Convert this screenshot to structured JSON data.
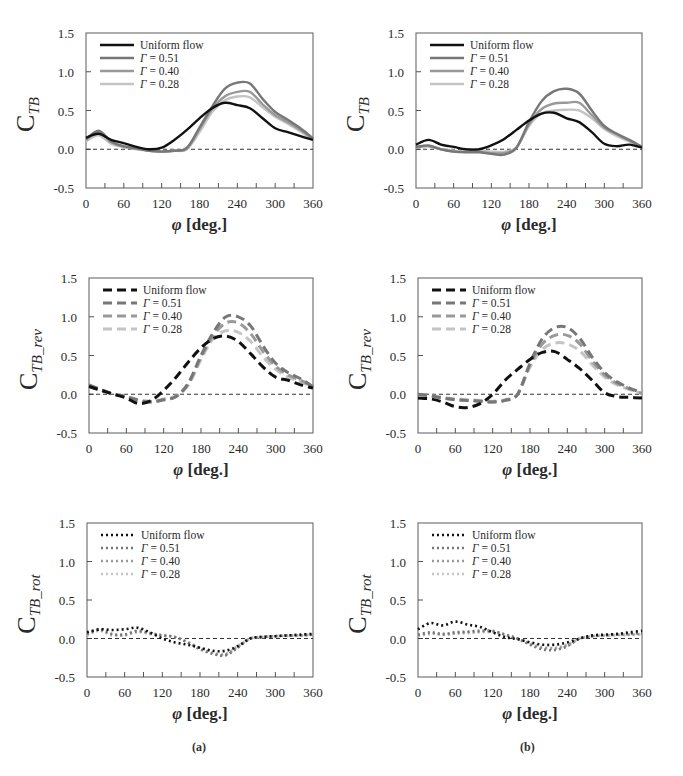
{
  "figure": {
    "captions": [
      "(a)",
      "(b)"
    ],
    "x_axis_label_symbol": "φ",
    "x_axis_label_unit": "[deg.]"
  },
  "chart_data": [
    {
      "id": "a1",
      "column": "a",
      "row": 1,
      "type": "line",
      "line_style": "solid",
      "ylabel_main": "C",
      "ylabel_sub": "TB",
      "xlabel": "φ [deg.]",
      "xlim": [
        0,
        360
      ],
      "ylim": [
        -0.5,
        1.5
      ],
      "xticks": [
        0,
        60,
        120,
        180,
        240,
        300,
        360
      ],
      "yticks": [
        -0.5,
        0.0,
        0.5,
        1.0,
        1.5
      ],
      "ytick_labels": [
        "-0.5",
        "0.0",
        "0.5",
        "1.0",
        "1.5"
      ],
      "zero_line": true,
      "grid": false,
      "legend_position": "upper-left",
      "x": [
        0,
        20,
        40,
        60,
        80,
        100,
        120,
        140,
        160,
        180,
        200,
        220,
        240,
        260,
        280,
        300,
        320,
        340,
        360
      ],
      "series": [
        {
          "name": "Uniform flow",
          "color": "#111111",
          "values": [
            0.15,
            0.2,
            0.12,
            0.08,
            0.03,
            0.0,
            0.02,
            0.12,
            0.25,
            0.4,
            0.53,
            0.6,
            0.57,
            0.53,
            0.4,
            0.27,
            0.22,
            0.17,
            0.12
          ]
        },
        {
          "name": "Γ = 0.51",
          "color": "#777777",
          "values": [
            0.13,
            0.24,
            0.1,
            0.04,
            0.01,
            -0.02,
            -0.03,
            -0.02,
            0.02,
            0.28,
            0.55,
            0.78,
            0.86,
            0.85,
            0.65,
            0.48,
            0.38,
            0.27,
            0.14
          ]
        },
        {
          "name": "Γ = 0.40",
          "color": "#999999",
          "values": [
            0.12,
            0.22,
            0.09,
            0.03,
            0.01,
            -0.02,
            -0.03,
            -0.02,
            0.01,
            0.26,
            0.52,
            0.68,
            0.74,
            0.74,
            0.58,
            0.44,
            0.35,
            0.25,
            0.13
          ]
        },
        {
          "name": "Γ = 0.28",
          "color": "#c4c4c4",
          "values": [
            0.1,
            0.18,
            0.07,
            0.03,
            0.0,
            -0.02,
            -0.03,
            -0.02,
            0.0,
            0.22,
            0.48,
            0.63,
            0.68,
            0.67,
            0.54,
            0.42,
            0.33,
            0.23,
            0.12
          ]
        }
      ]
    },
    {
      "id": "b1",
      "column": "b",
      "row": 1,
      "type": "line",
      "line_style": "solid",
      "ylabel_main": "C",
      "ylabel_sub": "TB",
      "xlabel": "φ [deg.]",
      "xlim": [
        0,
        360
      ],
      "ylim": [
        -0.5,
        1.5
      ],
      "xticks": [
        0,
        60,
        120,
        180,
        240,
        300,
        360
      ],
      "yticks": [
        -0.5,
        0.0,
        0.5,
        1.0,
        1.5
      ],
      "ytick_labels": [
        "-0.5",
        "0.0",
        "0.5",
        "1.0",
        "1.5"
      ],
      "zero_line": true,
      "grid": false,
      "legend_position": "upper-left",
      "x": [
        0,
        20,
        40,
        60,
        80,
        100,
        120,
        140,
        160,
        180,
        200,
        220,
        240,
        260,
        280,
        300,
        320,
        340,
        360
      ],
      "series": [
        {
          "name": "Uniform flow",
          "color": "#111111",
          "values": [
            0.06,
            0.12,
            0.06,
            0.03,
            0.0,
            0.0,
            0.05,
            0.13,
            0.25,
            0.37,
            0.46,
            0.47,
            0.4,
            0.35,
            0.22,
            0.07,
            0.04,
            0.06,
            0.02
          ]
        },
        {
          "name": "Γ = 0.51",
          "color": "#777777",
          "values": [
            0.03,
            0.05,
            0.0,
            -0.03,
            -0.04,
            -0.04,
            -0.06,
            -0.07,
            0.02,
            0.35,
            0.62,
            0.75,
            0.78,
            0.72,
            0.5,
            0.3,
            0.2,
            0.12,
            0.03
          ]
        },
        {
          "name": "Γ = 0.40",
          "color": "#999999",
          "values": [
            0.02,
            0.04,
            0.0,
            -0.03,
            -0.03,
            -0.03,
            -0.05,
            -0.05,
            0.02,
            0.32,
            0.52,
            0.59,
            0.6,
            0.6,
            0.44,
            0.28,
            0.19,
            0.11,
            0.03
          ]
        },
        {
          "name": "Γ = 0.28",
          "color": "#c4c4c4",
          "values": [
            0.02,
            0.04,
            0.0,
            -0.02,
            -0.03,
            -0.02,
            -0.03,
            -0.03,
            0.02,
            0.3,
            0.46,
            0.5,
            0.51,
            0.5,
            0.4,
            0.26,
            0.17,
            0.1,
            0.03
          ]
        }
      ]
    },
    {
      "id": "a2",
      "column": "a",
      "row": 2,
      "type": "line",
      "line_style": "dashed",
      "ylabel_main": "C",
      "ylabel_sub": "TB_rev",
      "xlabel": "φ [deg.]",
      "xlim": [
        0,
        360
      ],
      "ylim": [
        -0.5,
        1.5
      ],
      "xticks": [
        0,
        60,
        120,
        180,
        240,
        300,
        360
      ],
      "yticks": [
        -0.5,
        0.0,
        0.5,
        1.0,
        1.5
      ],
      "ytick_labels": [
        "-0.5",
        "0.0",
        "0.5",
        "1.0",
        "1.5"
      ],
      "zero_line": true,
      "grid": false,
      "legend_position": "upper-left",
      "x": [
        0,
        20,
        40,
        60,
        80,
        100,
        120,
        140,
        160,
        180,
        200,
        220,
        240,
        260,
        280,
        300,
        320,
        340,
        360
      ],
      "series": [
        {
          "name": "Uniform flow",
          "color": "#111111",
          "values": [
            0.1,
            0.05,
            0.0,
            -0.05,
            -0.12,
            -0.08,
            0.05,
            0.22,
            0.42,
            0.6,
            0.72,
            0.75,
            0.68,
            0.52,
            0.35,
            0.22,
            0.18,
            0.12,
            0.08
          ]
        },
        {
          "name": "Γ = 0.51",
          "color": "#777777",
          "values": [
            0.12,
            0.06,
            0.0,
            -0.03,
            -0.08,
            -0.1,
            -0.07,
            -0.03,
            0.15,
            0.5,
            0.8,
            1.0,
            1.0,
            0.88,
            0.62,
            0.4,
            0.28,
            0.2,
            0.1
          ]
        },
        {
          "name": "Γ = 0.40",
          "color": "#999999",
          "values": [
            0.11,
            0.05,
            0.0,
            -0.03,
            -0.08,
            -0.1,
            -0.07,
            -0.03,
            0.14,
            0.48,
            0.76,
            0.92,
            0.92,
            0.78,
            0.55,
            0.36,
            0.25,
            0.18,
            0.1
          ]
        },
        {
          "name": "Γ = 0.28",
          "color": "#c4c4c4",
          "values": [
            0.1,
            0.05,
            0.0,
            -0.03,
            -0.07,
            -0.09,
            -0.06,
            -0.02,
            0.12,
            0.45,
            0.72,
            0.82,
            0.8,
            0.68,
            0.48,
            0.32,
            0.22,
            0.16,
            0.09
          ]
        }
      ]
    },
    {
      "id": "b2",
      "column": "b",
      "row": 2,
      "type": "line",
      "line_style": "dashed",
      "ylabel_main": "C",
      "ylabel_sub": "TB_rev",
      "xlabel": "φ [deg.]",
      "xlim": [
        0,
        360
      ],
      "ylim": [
        -0.5,
        1.5
      ],
      "xticks": [
        0,
        60,
        120,
        180,
        240,
        300,
        360
      ],
      "yticks": [
        -0.5,
        0.0,
        0.5,
        1.0,
        1.5
      ],
      "ytick_labels": [
        "-0.5",
        "0.0",
        "0.5",
        "1.0",
        "1.5"
      ],
      "zero_line": true,
      "grid": false,
      "legend_position": "upper-left",
      "x": [
        0,
        20,
        40,
        60,
        80,
        100,
        120,
        140,
        160,
        180,
        200,
        220,
        240,
        260,
        280,
        300,
        320,
        340,
        360
      ],
      "series": [
        {
          "name": "Uniform flow",
          "color": "#111111",
          "values": [
            -0.05,
            -0.06,
            -0.1,
            -0.16,
            -0.17,
            -0.12,
            0.0,
            0.18,
            0.32,
            0.45,
            0.54,
            0.55,
            0.45,
            0.33,
            0.18,
            0.02,
            -0.03,
            -0.04,
            -0.05
          ]
        },
        {
          "name": "Γ = 0.51",
          "color": "#777777",
          "values": [
            0.0,
            -0.02,
            -0.05,
            -0.07,
            -0.08,
            -0.09,
            -0.1,
            -0.08,
            0.0,
            0.4,
            0.72,
            0.86,
            0.86,
            0.72,
            0.48,
            0.28,
            0.16,
            0.08,
            0.02
          ]
        },
        {
          "name": "Γ = 0.40",
          "color": "#999999",
          "values": [
            0.0,
            -0.02,
            -0.05,
            -0.07,
            -0.08,
            -0.09,
            -0.1,
            -0.08,
            0.0,
            0.38,
            0.65,
            0.76,
            0.76,
            0.65,
            0.43,
            0.25,
            0.14,
            0.07,
            0.01
          ]
        },
        {
          "name": "Γ = 0.28",
          "color": "#c4c4c4",
          "values": [
            0.0,
            -0.02,
            -0.04,
            -0.06,
            -0.07,
            -0.08,
            -0.09,
            -0.07,
            0.0,
            0.35,
            0.58,
            0.66,
            0.65,
            0.56,
            0.38,
            0.22,
            0.12,
            0.06,
            0.01
          ]
        }
      ]
    },
    {
      "id": "a3",
      "column": "a",
      "row": 3,
      "type": "line",
      "line_style": "dotted",
      "ylabel_main": "C",
      "ylabel_sub": "TB_rot",
      "xlabel": "φ [deg.]",
      "xlim": [
        0,
        360
      ],
      "ylim": [
        -0.5,
        1.5
      ],
      "xticks": [
        0,
        60,
        120,
        180,
        240,
        300,
        360
      ],
      "yticks": [
        -0.5,
        0.0,
        0.5,
        1.0,
        1.5
      ],
      "ytick_labels": [
        "-0.5",
        "0.0",
        "0.5",
        "1.0",
        "1.5"
      ],
      "zero_line": true,
      "grid": false,
      "legend_position": "upper-left",
      "x": [
        0,
        20,
        40,
        60,
        80,
        100,
        120,
        140,
        160,
        180,
        200,
        220,
        240,
        260,
        280,
        300,
        320,
        340,
        360
      ],
      "series": [
        {
          "name": "Uniform flow",
          "color": "#111111",
          "values": [
            0.08,
            0.12,
            0.11,
            0.12,
            0.14,
            0.08,
            0.0,
            -0.05,
            -0.08,
            -0.12,
            -0.16,
            -0.16,
            -0.1,
            0.0,
            0.02,
            0.03,
            0.04,
            0.05,
            0.06
          ]
        },
        {
          "name": "Γ = 0.51",
          "color": "#777777",
          "values": [
            0.06,
            0.12,
            0.06,
            0.05,
            0.1,
            0.07,
            0.04,
            0.02,
            -0.05,
            -0.14,
            -0.2,
            -0.22,
            -0.12,
            0.0,
            0.02,
            0.03,
            0.04,
            0.04,
            0.05
          ]
        },
        {
          "name": "Γ = 0.40",
          "color": "#999999",
          "values": [
            0.05,
            0.11,
            0.05,
            0.05,
            0.09,
            0.07,
            0.04,
            0.02,
            -0.05,
            -0.13,
            -0.19,
            -0.21,
            -0.11,
            0.0,
            0.02,
            0.03,
            0.04,
            0.04,
            0.05
          ]
        },
        {
          "name": "Γ = 0.28",
          "color": "#c4c4c4",
          "values": [
            0.04,
            0.1,
            0.04,
            0.04,
            0.08,
            0.06,
            0.04,
            0.02,
            -0.04,
            -0.12,
            -0.18,
            -0.2,
            -0.1,
            0.0,
            0.02,
            0.03,
            0.03,
            0.04,
            0.05
          ]
        }
      ]
    },
    {
      "id": "b3",
      "column": "b",
      "row": 3,
      "type": "line",
      "line_style": "dotted",
      "ylabel_main": "C",
      "ylabel_sub": "TB_rot",
      "xlabel": "φ [deg.]",
      "xlim": [
        0,
        360
      ],
      "ylim": [
        -0.5,
        1.5
      ],
      "xticks": [
        0,
        60,
        120,
        180,
        240,
        300,
        360
      ],
      "yticks": [
        -0.5,
        0.0,
        0.5,
        1.0,
        1.5
      ],
      "ytick_labels": [
        "-0.5",
        "0.0",
        "0.5",
        "1.0",
        "1.5"
      ],
      "zero_line": true,
      "grid": false,
      "legend_position": "upper-left",
      "x": [
        0,
        20,
        40,
        60,
        80,
        100,
        120,
        140,
        160,
        180,
        200,
        220,
        240,
        260,
        280,
        300,
        320,
        340,
        360
      ],
      "series": [
        {
          "name": "Uniform flow",
          "color": "#111111",
          "values": [
            0.12,
            0.2,
            0.17,
            0.22,
            0.18,
            0.15,
            0.08,
            0.02,
            -0.01,
            -0.05,
            -0.08,
            -0.08,
            -0.05,
            0.0,
            0.04,
            0.05,
            0.06,
            0.08,
            0.1
          ]
        },
        {
          "name": "Γ = 0.51",
          "color": "#777777",
          "values": [
            0.05,
            0.08,
            0.06,
            0.08,
            0.09,
            0.1,
            0.1,
            0.05,
            0.0,
            -0.08,
            -0.14,
            -0.15,
            -0.1,
            0.0,
            0.03,
            0.04,
            0.05,
            0.06,
            0.07
          ]
        },
        {
          "name": "Γ = 0.40",
          "color": "#999999",
          "values": [
            0.04,
            0.07,
            0.05,
            0.07,
            0.08,
            0.09,
            0.09,
            0.05,
            0.0,
            -0.07,
            -0.12,
            -0.13,
            -0.09,
            0.0,
            0.03,
            0.04,
            0.05,
            0.05,
            0.06
          ]
        },
        {
          "name": "Γ = 0.28",
          "color": "#c4c4c4",
          "values": [
            0.03,
            0.06,
            0.05,
            0.06,
            0.07,
            0.08,
            0.08,
            0.05,
            0.0,
            -0.06,
            -0.11,
            -0.12,
            -0.08,
            0.0,
            0.03,
            0.04,
            0.04,
            0.05,
            0.05
          ]
        }
      ]
    }
  ]
}
